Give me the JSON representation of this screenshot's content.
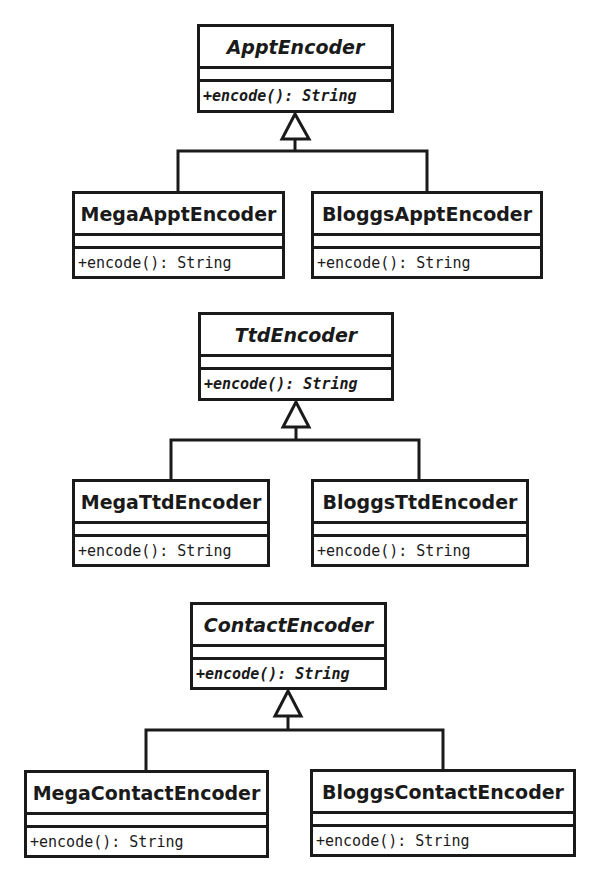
{
  "diagram": {
    "type": "uml-class-diagram",
    "hierarchies": [
      {
        "parent": {
          "name": "ApptEncoder",
          "abstract": true,
          "operation": "+encode(): String"
        },
        "children": [
          {
            "name": "MegaApptEncoder",
            "operation": "+encode(): String"
          },
          {
            "name": "BloggsApptEncoder",
            "operation": "+encode(): String"
          }
        ]
      },
      {
        "parent": {
          "name": "TtdEncoder",
          "abstract": true,
          "operation": "+encode(): String"
        },
        "children": [
          {
            "name": "MegaTtdEncoder",
            "operation": "+encode(): String"
          },
          {
            "name": "BloggsTtdEncoder",
            "operation": "+encode(): String"
          }
        ]
      },
      {
        "parent": {
          "name": "ContactEncoder",
          "abstract": true,
          "operation": "+encode(): String"
        },
        "children": [
          {
            "name": "MegaContactEncoder",
            "operation": "+encode(): String"
          },
          {
            "name": "BloggsContactEncoder",
            "operation": "+encode(): String"
          }
        ]
      }
    ],
    "relationship": "generalization",
    "colors": {
      "line": "#1a1a1a",
      "background": "#ffffff"
    }
  }
}
